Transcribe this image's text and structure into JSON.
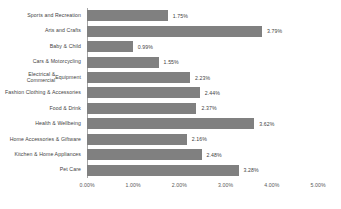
{
  "chart_data": {
    "type": "bar",
    "orientation": "horizontal",
    "title": "",
    "xlabel": "",
    "ylabel": "",
    "xlim": [
      0,
      5
    ],
    "grid": false,
    "legend": false,
    "value_format": "percent",
    "bar_color": "#808080",
    "axis_color": "#a6a6a6",
    "text_color": "#3f3f3f",
    "categories": [
      "Sports and Recreation",
      "Arts and Crafts",
      "Baby & Child",
      "Cars & Motorcycling",
      "Electrical & Commercial Equipment",
      "Fashion Clothing & Accessories",
      "Food & Drink",
      "Health & Wellbeing",
      "Home Accessories & Giftware",
      "Kitchen & Home Appliances",
      "Pet Care"
    ],
    "category_lines": [
      [
        "Sports and Recreation"
      ],
      [
        "Arts and Crafts"
      ],
      [
        "Baby & Child"
      ],
      [
        "Cars & Motorcycling"
      ],
      [
        "Electrical & Commercial",
        "Equipment"
      ],
      [
        "Fashion Clothing & Accessories"
      ],
      [
        "Food & Drink"
      ],
      [
        "Health & Wellbeing"
      ],
      [
        "Home Accessories & Giftware"
      ],
      [
        "Kitchen & Home Appliances"
      ],
      [
        "Pet Care"
      ]
    ],
    "values": [
      1.75,
      3.79,
      0.99,
      1.55,
      2.23,
      2.44,
      2.37,
      3.62,
      2.16,
      2.48,
      3.28
    ],
    "value_labels": [
      "1.75%",
      "3.79%",
      "0.99%",
      "1.55%",
      "2.23%",
      "2.44%",
      "2.37%",
      "3.62%",
      "2.16%",
      "2.48%",
      "3.28%"
    ],
    "xticks": [
      0,
      1,
      2,
      3,
      4,
      5
    ],
    "xtick_labels": [
      "0.00%",
      "1.00%",
      "2.00%",
      "3.00%",
      "4.00%",
      "5.00%"
    ]
  }
}
